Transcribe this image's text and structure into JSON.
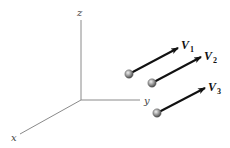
{
  "diagram": {
    "colors": {
      "axis": "#8a8a8a",
      "arrow": "#111111",
      "ball_light": "#e6e6e6",
      "ball_mid": "#9a9a9a",
      "ball_dark": "#4a4a4a",
      "background": "#ffffff"
    },
    "axes": {
      "origin": [
        81,
        100
      ],
      "x": {
        "label": "x",
        "end": [
          20,
          134
        ],
        "label_pos": [
          13,
          141
        ]
      },
      "y": {
        "label": "y",
        "end": [
          140,
          100
        ],
        "label_pos": [
          144,
          104
        ]
      },
      "z": {
        "label": "z",
        "end": [
          81,
          20
        ],
        "label_pos": [
          77,
          16
        ]
      }
    },
    "vectors": [
      {
        "name": "V",
        "subscript": "1",
        "ball": [
          129,
          74
        ],
        "tip": [
          178,
          48
        ],
        "label_pos": [
          181,
          49
        ]
      },
      {
        "name": "V",
        "subscript": "2",
        "ball": [
          152,
          83
        ],
        "tip": [
          201,
          57
        ],
        "label_pos": [
          204,
          60
        ]
      },
      {
        "name": "V",
        "subscript": "3",
        "ball": [
          157,
          113
        ],
        "tip": [
          205,
          88
        ],
        "label_pos": [
          208,
          91
        ]
      }
    ]
  }
}
